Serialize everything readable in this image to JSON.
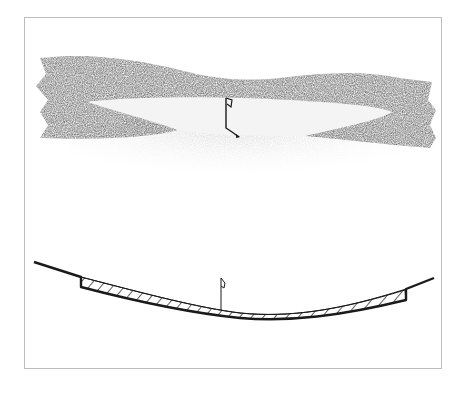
{
  "figure": {
    "colors": {
      "frame": "#bdbdbd",
      "shading_dark": "#6e6e6e",
      "shading_light": "#d9d9d9",
      "green_fill": "#f4f4f4",
      "ink": "#1a1a1a"
    },
    "plan_view": {
      "elements": [
        "shaded-surround",
        "green",
        "flagstick"
      ]
    },
    "section_view": {
      "elements": [
        "ground-line",
        "hatched-layer",
        "flagstick"
      ]
    }
  }
}
